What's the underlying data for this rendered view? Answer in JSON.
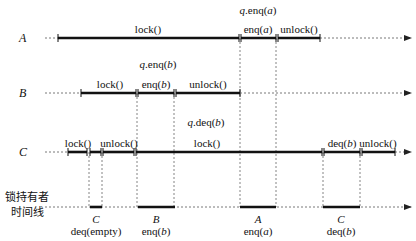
{
  "diagram": {
    "threads": [
      {
        "name": "A",
        "y": 38,
        "start_dashed": 45,
        "segments": [
          {
            "label": "lock()",
            "x1": 58,
            "x2": 239
          },
          {
            "label": "enq(a)",
            "x1": 241,
            "x2": 276
          },
          {
            "label": "unlock()",
            "x1": 278,
            "x2": 320
          }
        ],
        "end_arrow": 412,
        "call_annotation": {
          "text": "q.enq(a)",
          "x": 258,
          "y": 9
        }
      },
      {
        "name": "B",
        "y": 93,
        "start_dashed": 45,
        "segments": [
          {
            "label": "lock()",
            "x1": 81,
            "x2": 136
          },
          {
            "label": "enq(b)",
            "x1": 138,
            "x2": 174
          },
          {
            "label": "unlock()",
            "x1": 176,
            "x2": 240
          }
        ],
        "end_arrow": 412,
        "call_annotation": {
          "text": "q.enq(b)",
          "x": 158,
          "y": 63
        }
      },
      {
        "name": "C",
        "y": 152,
        "start_dashed": 45,
        "segments": [
          {
            "label": "lock()",
            "x1": 68,
            "x2": 87
          },
          {
            "label": "",
            "x1": 90,
            "x2": 101
          },
          {
            "label": "unlock()",
            "x1": 103,
            "x2": 134
          },
          {
            "label": "lock()",
            "x1": 137,
            "x2": 322
          },
          {
            "label": "deq(b)",
            "x1": 324,
            "x2": 360
          },
          {
            "label": "unlock()",
            "x1": 362,
            "x2": 395
          }
        ],
        "end_arrow": 412,
        "call_annotation": {
          "text": "q.deq(b)",
          "x": 206,
          "y": 121
        }
      }
    ],
    "lock_holder_timeline": {
      "label_line1": "锁持有者",
      "label_line2": "时间线",
      "y": 207,
      "start": 45,
      "end_arrow": 412,
      "intervals": [
        {
          "holder": "C",
          "op": "deq(empty)",
          "x1": 91,
          "x2": 101
        },
        {
          "holder": "B",
          "op": "enq(b)",
          "x1": 139,
          "x2": 174
        },
        {
          "holder": "A",
          "op": "enq(a)",
          "x1": 240,
          "x2": 276
        },
        {
          "holder": "C",
          "op": "deq(b)",
          "x1": 324,
          "x2": 359
        }
      ]
    },
    "labels": {
      "A_name": "A",
      "B_name": "B",
      "C_name": "C",
      "A_call": "q.enq(a)",
      "B_call": "q.enq(b)",
      "C_call": "q.deq(b)",
      "A_lock": "lock()",
      "A_enq": "enq(a)",
      "A_unlock": "unlock()",
      "B_lock": "lock()",
      "B_enq": "enq(b)",
      "B_unlock": "unlock()",
      "C_lock1": "lock()",
      "C_unlock1": "unlock()",
      "C_lock2": "lock()",
      "C_deq": "deq(b)",
      "C_unlock2": "unlock()",
      "tl_line1": "锁持有者",
      "tl_line2": "时间线",
      "tl_h1": "C",
      "tl_op1": "deq(empty)",
      "tl_h2": "B",
      "tl_op2": "enq(b)",
      "tl_h3": "A",
      "tl_op3": "enq(a)",
      "tl_h4": "C",
      "tl_op4": "deq(b)"
    },
    "colors": {
      "line": "#111111",
      "dashed": "#555555",
      "background": "#ffffff"
    }
  }
}
